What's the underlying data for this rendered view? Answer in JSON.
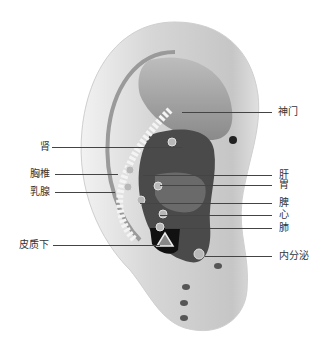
{
  "diagram": {
    "labels_left": [
      {
        "id": "shen",
        "text": "肾",
        "x": 40,
        "y": 142,
        "line_x1": 52,
        "line_x2": 182
      },
      {
        "id": "xiongzhui",
        "text": "胸椎",
        "x": 30,
        "y": 169,
        "line_x1": 55,
        "line_x2": 118
      },
      {
        "id": "rujian",
        "text": "乳腺",
        "x": 30,
        "y": 187,
        "line_x1": 55,
        "line_x2": 115
      },
      {
        "id": "pizhixia",
        "text": "皮质下",
        "x": 19,
        "y": 240,
        "line_x1": 53,
        "line_x2": 160
      }
    ],
    "labels_right": [
      {
        "id": "shenmen",
        "text": "神门",
        "x": 278,
        "y": 107,
        "line_x1": 182,
        "line_x2": 272
      },
      {
        "id": "gan",
        "text": "肝",
        "x": 279,
        "y": 170,
        "line_x1": 143,
        "line_x2": 272
      },
      {
        "id": "wei",
        "text": "胃",
        "x": 279,
        "y": 180,
        "line_x1": 160,
        "line_x2": 272
      },
      {
        "id": "pi",
        "text": "脾",
        "x": 279,
        "y": 198,
        "line_x1": 140,
        "line_x2": 272
      },
      {
        "id": "xin",
        "text": "心",
        "x": 279,
        "y": 210,
        "line_x1": 160,
        "line_x2": 272
      },
      {
        "id": "fei",
        "text": "肺",
        "x": 279,
        "y": 223,
        "line_x1": 165,
        "line_x2": 272
      },
      {
        "id": "neifenmi",
        "text": "内分泌",
        "x": 279,
        "y": 251,
        "line_x1": 205,
        "line_x2": 272
      }
    ],
    "colors": {
      "ear_light": "#e6e6e6",
      "ear_mid": "#bdbdbd",
      "ear_dark": "#6e6e6e",
      "cavity": "#3a3a3a",
      "line": "#444444",
      "text": "#333333"
    }
  }
}
